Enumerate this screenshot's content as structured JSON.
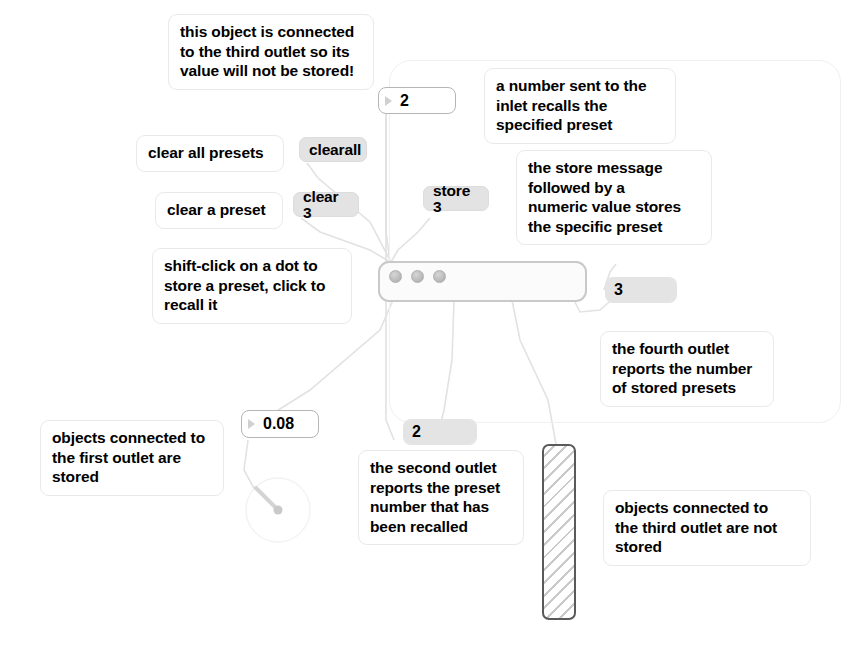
{
  "patch": {
    "title": "preset object patch",
    "comments": [
      {
        "id": "comment-third-outlet-not-stored-top",
        "text": "this object is connected\nto the third outlet so its\nvalue will not be stored!"
      },
      {
        "id": "comment-number-inlet-recalls",
        "text": "a number sent to the\ninlet recalls the\nspecified preset"
      },
      {
        "id": "comment-clear-all-presets",
        "text": "clear all presets"
      },
      {
        "id": "comment-store-message",
        "text": "the store message\nfollowed by a\nnumeric value stores\nthe specific preset"
      },
      {
        "id": "comment-clear-a-preset",
        "text": "clear a preset"
      },
      {
        "id": "comment-shift-click",
        "text": "shift-click on a dot to\nstore a preset, click to\nrecall it"
      },
      {
        "id": "comment-fourth-outlet",
        "text": "the fourth outlet\nreports the number\nof stored presets"
      },
      {
        "id": "comment-first-outlet-stored",
        "text": "objects connected to\nthe first outlet are\nstored"
      },
      {
        "id": "comment-second-outlet",
        "text": "the second outlet\nreports the preset\nnumber that has\nbeen recalled"
      },
      {
        "id": "comment-third-outlet-not-stored",
        "text": "objects connected to\nthe third outlet are not\nstored"
      }
    ],
    "messages": [
      {
        "id": "message-clearall",
        "text": "clearall"
      },
      {
        "id": "message-clear-3",
        "text": "clear 3"
      },
      {
        "id": "message-store-3",
        "text": "store 3"
      }
    ],
    "number_boxes": [
      {
        "id": "number-box-preset-recall",
        "value": "2"
      },
      {
        "id": "number-box-float",
        "value": "0.08"
      }
    ],
    "number_displays": [
      {
        "id": "number-display-stored-count",
        "value": "3"
      },
      {
        "id": "number-display-recalled-preset",
        "value": "2"
      }
    ],
    "preset_object": {
      "id": "preset-object",
      "stored_dots": 3,
      "total_dot_slots": 3
    },
    "slider": {
      "id": "vertical-slider",
      "orientation": "vertical"
    },
    "dial": {
      "id": "dial-knob"
    },
    "colors": {
      "message_fill": "#e3e3e3",
      "number_display_fill": "#e4e4e4",
      "preset_border": "#c9c9c9",
      "slider_border": "#5a5a5a",
      "wire": "#e0e0e0",
      "text": "#000000"
    }
  }
}
